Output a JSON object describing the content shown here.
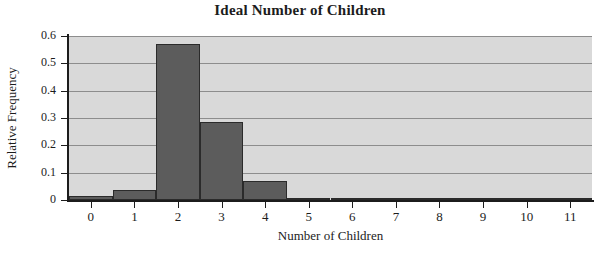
{
  "chart_data": {
    "type": "bar",
    "title": "Ideal Number of Children",
    "xlabel": "Number of Children",
    "ylabel": "Relative Frequency",
    "categories": [
      "0",
      "1",
      "2",
      "3",
      "4",
      "5",
      "6",
      "7",
      "8",
      "9",
      "10",
      "11"
    ],
    "values": [
      0.015,
      0.035,
      0.572,
      0.285,
      0.068,
      0.008,
      0.003,
      0.001,
      0.0,
      0.0,
      0.004,
      0.0
    ],
    "xlim": [
      -0.5,
      11.5
    ],
    "ylim": [
      0,
      0.6
    ],
    "ytick_labels": [
      "0.6",
      "0.5",
      "0.4",
      "0.3",
      "0.2",
      "0.1",
      "0"
    ],
    "ytick_values": [
      0.6,
      0.5,
      0.4,
      0.3,
      0.2,
      0.1,
      0
    ],
    "grid": true,
    "legend": "none",
    "colors": {
      "bar_fill": "#5c5c5c",
      "bar_edge": "#2b2b2b",
      "plot_background": "#d9d9d9",
      "gridline": "#8d8d8d",
      "axis": "#1c1c1c",
      "text": "#1c1c1c",
      "page_background": "#ffffff"
    }
  }
}
